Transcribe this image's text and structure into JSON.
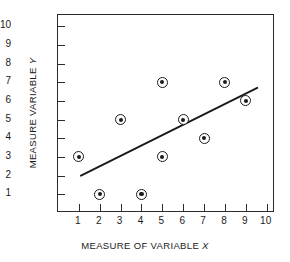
{
  "chart_data": {
    "type": "scatter",
    "title": "",
    "xlabel": "MEASURE OF VARIABLE X",
    "xlabel_prefix": "MEASURE OF VARIABLE ",
    "xlabel_variable": "X",
    "ylabel": "MEASURE VARIABLE Y",
    "ylabel_prefix": "MEASURE VARIABLE ",
    "ylabel_variable": "Y",
    "xlim": [
      0,
      10.4
    ],
    "ylim": [
      0,
      10.6
    ],
    "xticks": [
      1,
      2,
      3,
      4,
      5,
      6,
      7,
      8,
      9,
      10
    ],
    "yticks": [
      1,
      2,
      3,
      4,
      5,
      6,
      7,
      8,
      9,
      10
    ],
    "xtick_labels": [
      "1",
      "2",
      "3",
      "4",
      "5",
      "6",
      "7",
      "8",
      "9",
      "10"
    ],
    "ytick_labels": [
      "1",
      "2",
      "3",
      "4",
      "5",
      "6",
      "7",
      "8",
      "9",
      "10"
    ],
    "grid": false,
    "legend": null,
    "marker_style": "bullseye",
    "points": [
      {
        "x": 1,
        "y": 3
      },
      {
        "x": 2,
        "y": 1
      },
      {
        "x": 3,
        "y": 5
      },
      {
        "x": 4,
        "y": 1
      },
      {
        "x": 5,
        "y": 3
      },
      {
        "x": 5,
        "y": 7
      },
      {
        "x": 6,
        "y": 5
      },
      {
        "x": 7,
        "y": 4
      },
      {
        "x": 8,
        "y": 7
      },
      {
        "x": 9,
        "y": 6
      }
    ],
    "trendline": {
      "name": "line of best fit",
      "x0": 1.1,
      "y0": 2.0,
      "x1": 9.55,
      "y1": 6.7,
      "color": "#1a1a1a"
    },
    "colors": {
      "axis": "#2b2b2b",
      "marker": "#1a1a1a",
      "background": "#ffffff",
      "text": "#1a1a1a"
    }
  }
}
